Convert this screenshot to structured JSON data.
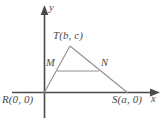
{
  "figure": {
    "type": "geometry-diagram",
    "width": 168,
    "height": 124,
    "background_color": "#ffffff",
    "axis_color": "#4a4a4a",
    "triangle_color": "#8f8f8f",
    "midsegment_color": "#8f8f8f",
    "label_color": "#4a4a4a"
  },
  "axes": {
    "x_axis_label": "x",
    "y_axis_label": "y",
    "origin_label": "R(0, 0)"
  },
  "labels": {
    "vertex_T": "T(b, c)",
    "vertex_R": "R(0, 0)",
    "vertex_S": "S(a, 0)",
    "point_M": "M",
    "point_N": "N",
    "axis_x": "x",
    "axis_y": "y"
  },
  "points": {
    "R": {
      "label": "R(0, 0)",
      "x": 44,
      "y": 93
    },
    "T": {
      "label": "T(b, c)",
      "x": 70,
      "y": 46
    },
    "S": {
      "label": "S(a, 0)",
      "x": 128,
      "y": 93
    },
    "M": {
      "label": "M",
      "x": 57,
      "y": 70
    },
    "N": {
      "label": "N",
      "x": 99,
      "y": 70
    }
  },
  "segments": [
    {
      "name": "RT",
      "from": "R",
      "to": "T"
    },
    {
      "name": "TS",
      "from": "T",
      "to": "S"
    },
    {
      "name": "RS",
      "from": "R",
      "to": "S"
    },
    {
      "name": "MN",
      "from": "M",
      "to": "N"
    }
  ]
}
